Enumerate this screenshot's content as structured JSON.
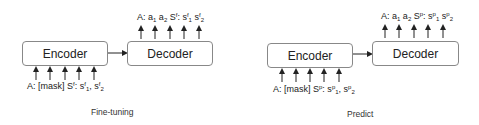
{
  "panels": [
    {
      "caption": "Fine-tuning",
      "encoder_label": "Encoder",
      "decoder_label": "Decoder",
      "input_tokens": [
        "A:",
        "[mask]",
        "S^f:",
        "s^f_1",
        "s^f_2"
      ],
      "output_tokens": [
        "A:",
        "a_1",
        "a_2",
        "S^f:",
        "s^f_1",
        "s^f_2"
      ],
      "input": {
        "a": "A: [mask] S",
        "sup1": "f",
        "b": ": s",
        "sup2": "f",
        "sub2": "1",
        "c": ", s",
        "sup3": "f",
        "sub3": "2"
      },
      "output": {
        "a": "A: a",
        "sub1": "1",
        "b": " a",
        "sub2": "2",
        "c": " S",
        "sup3": "f",
        "d": ": s",
        "sup4": "f",
        "sub4": "1",
        "e": " s",
        "sup5": "f",
        "sub5": "2"
      }
    },
    {
      "caption": "Predict",
      "encoder_label": "Encoder",
      "decoder_label": "Decoder",
      "input_tokens": [
        "A:",
        "[mask]",
        "S^p:",
        "s^p_1",
        "s^p_2"
      ],
      "output_tokens": [
        "A:",
        "a_1",
        "a_2",
        "S^p:",
        "s^p_1",
        "s^p_2"
      ],
      "input": {
        "a": "A: [mask] S",
        "sup1": "p",
        "b": ": s",
        "sup2": "p",
        "sub2": "1",
        "c": ", s",
        "sup3": "p",
        "sub3": "2"
      },
      "output": {
        "a": "A: a",
        "sub1": "1",
        "b": " a",
        "sub2": "2",
        "c": " S",
        "sup3": "p",
        "d": ": s",
        "sup4": "p",
        "sub4": "1",
        "e": " s",
        "sup5": "p",
        "sub5": "2"
      }
    }
  ]
}
